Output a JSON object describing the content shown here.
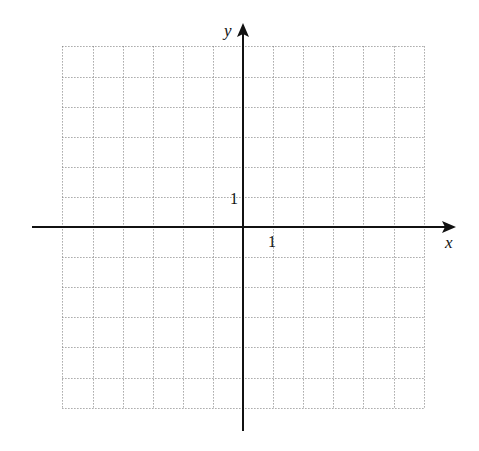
{
  "diagram": {
    "type": "coordinate-grid",
    "x_axis": {
      "label": "x",
      "tick_label": "1",
      "range": [
        -6,
        6
      ]
    },
    "y_axis": {
      "label": "y",
      "tick_label": "1",
      "range": [
        -6,
        6
      ]
    },
    "grid": {
      "style": "dotted",
      "color": "#7a7a7a",
      "step": 1
    },
    "axis_color": "#111111"
  }
}
